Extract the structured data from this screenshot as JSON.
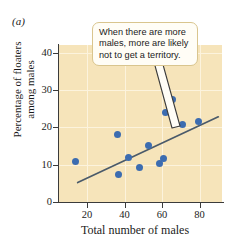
{
  "figure": {
    "panel_label": "(a)",
    "callout_text": "When there are more males, more are likely not to get a territory."
  },
  "colors": {
    "plot_background": "#f6e4ba",
    "gridline": "#fcf3dd",
    "point": "#3c6cb0",
    "trend_line": "#4a5a6a",
    "axis": "#3b3b3b",
    "callout_fill": "#fffdf6",
    "callout_border": "#d9c58e"
  },
  "chart_data": {
    "type": "scatter",
    "title": "",
    "xlabel": "Total number of males",
    "ylabel": "Percentage of floaters among males",
    "ylabel_line1": "Percentage of floaters",
    "ylabel_line2": "among males",
    "xlim": [
      5,
      92
    ],
    "ylim": [
      0,
      42
    ],
    "xticks": [
      20,
      40,
      60,
      80
    ],
    "xtick_labels": [
      "20",
      "40",
      "60",
      "80"
    ],
    "yticks": [
      0,
      10,
      20,
      30,
      40
    ],
    "ytick_labels": [
      "0",
      "10",
      "20",
      "30",
      "40"
    ],
    "grid": true,
    "legend": "none",
    "x": [
      14,
      36,
      36.5,
      42,
      48,
      53,
      58.5,
      61,
      62,
      65.5,
      71,
      79.5
    ],
    "y": [
      10.8,
      18.0,
      7.5,
      12.0,
      9.2,
      15.0,
      10.3,
      11.7,
      24.0,
      27.5,
      20.8,
      21.5
    ],
    "points": [
      {
        "x": 14,
        "y": 10.8
      },
      {
        "x": 36,
        "y": 18.0
      },
      {
        "x": 36.5,
        "y": 7.5
      },
      {
        "x": 42,
        "y": 12.0
      },
      {
        "x": 48,
        "y": 9.2
      },
      {
        "x": 53,
        "y": 15.0
      },
      {
        "x": 58.5,
        "y": 10.3
      },
      {
        "x": 61,
        "y": 11.7
      },
      {
        "x": 62,
        "y": 24.0
      },
      {
        "x": 65.5,
        "y": 27.5
      },
      {
        "x": 71,
        "y": 20.8
      },
      {
        "x": 79.5,
        "y": 21.5
      }
    ],
    "trend_line": {
      "x0": 15,
      "y0": 5.2,
      "x1": 90,
      "y1": 22.8
    },
    "annotations": [
      {
        "text": "When there are more males, more are likely not to get a territory.",
        "target_x": 73,
        "target_y": 22.5
      }
    ]
  }
}
